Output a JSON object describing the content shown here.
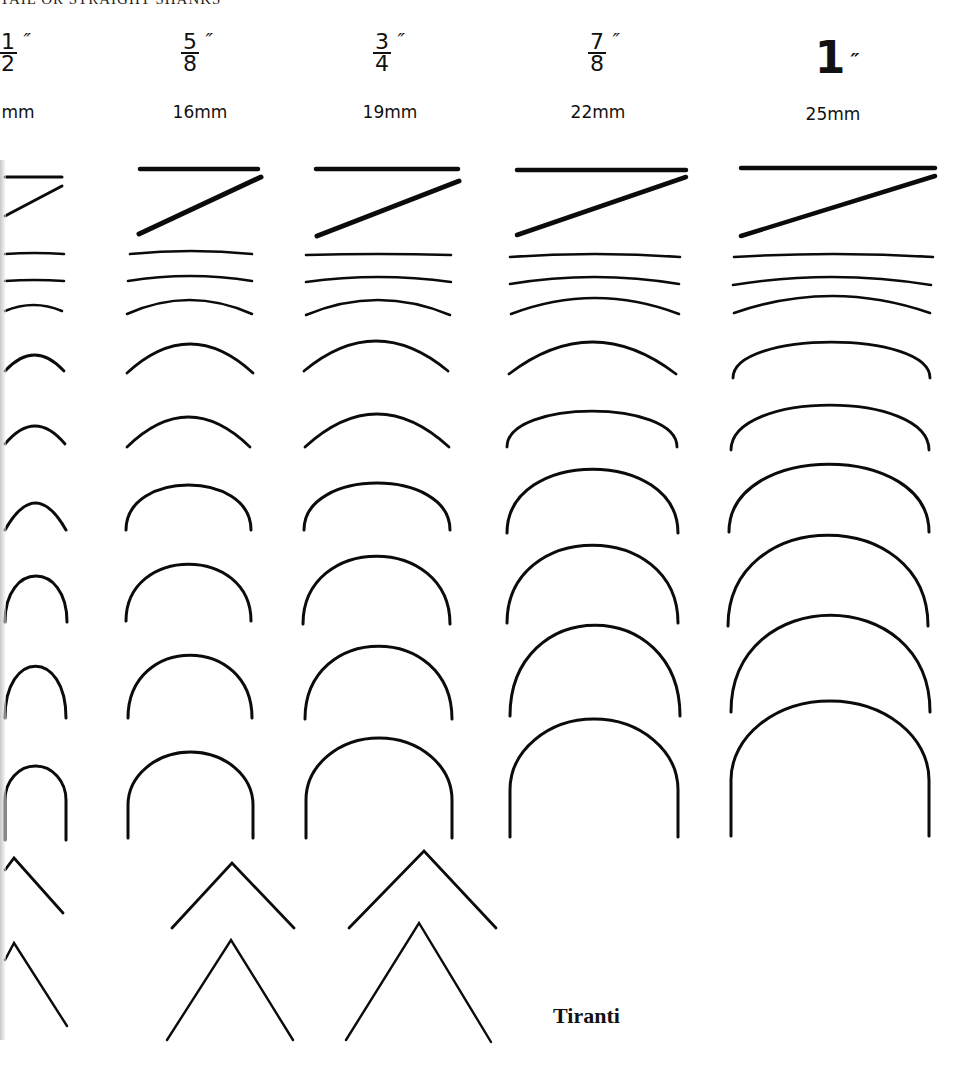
{
  "page": {
    "header_fragment": "TAIL OR STRAIGHT SHANKS",
    "caption": "Tiranti"
  },
  "columns": [
    {
      "id": "half",
      "numerator": "1",
      "denominator": "2",
      "inch_mark": "″",
      "mm": "13mm",
      "mm_visible": "mm",
      "left": -40,
      "center": 20
    },
    {
      "id": "5-8",
      "numerator": "5",
      "denominator": "8",
      "inch_mark": "″",
      "mm": "16mm",
      "mm_visible": "16mm",
      "left": 130,
      "center": 190
    },
    {
      "id": "3-4",
      "numerator": "3",
      "denominator": "4",
      "inch_mark": "″",
      "mm": "19mm",
      "mm_visible": "19mm",
      "left": 320,
      "center": 380
    },
    {
      "id": "7-8",
      "numerator": "7",
      "denominator": "8",
      "inch_mark": "″",
      "mm": "22mm",
      "mm_visible": "22mm",
      "left": 537,
      "center": 597
    },
    {
      "id": "1-inch",
      "whole": "1",
      "inch_mark": "″",
      "mm": "25mm",
      "mm_visible": "25mm",
      "left": 773,
      "center": 833
    }
  ],
  "chart_data": {
    "type": "table",
    "column_labels": [
      "1/2\" (13mm)",
      "5/8\" (16mm)",
      "3/4\" (19mm)",
      "7/8\" (22mm)",
      "1\" (25mm)"
    ],
    "row_labels": [
      "straight chisel",
      "skew chisel",
      "sweep 2",
      "sweep 3",
      "sweep 4",
      "sweep 5",
      "sweep 6",
      "sweep 7",
      "sweep 8",
      "sweep 9",
      "sweep 11 (U)",
      "V-tool wide",
      "V-tool narrow"
    ],
    "stroke_color": "#0b0b0b",
    "background": "#ffffff",
    "profiles": {
      "straight": [
        {
          "x1": 5,
          "x2": 62,
          "y": 177,
          "w": 3
        },
        {
          "x1": 140,
          "x2": 258,
          "y": 169,
          "w": 4.5
        },
        {
          "x1": 316,
          "x2": 458,
          "y": 169,
          "w": 4.5
        },
        {
          "x1": 517,
          "x2": 686,
          "y": 170,
          "w": 4.5
        },
        {
          "x1": 741,
          "x2": 935,
          "y": 168,
          "w": 4.5
        }
      ],
      "skew": [
        {
          "x1": 5,
          "y1": 216,
          "x2": 62,
          "y2": 186,
          "w": 3
        },
        {
          "x1": 139,
          "y1": 234,
          "x2": 261,
          "y2": 177,
          "w": 5
        },
        {
          "x1": 317,
          "y1": 236,
          "x2": 459,
          "y2": 181,
          "w": 5
        },
        {
          "x1": 517,
          "y1": 235,
          "x2": 686,
          "y2": 177,
          "w": 4.5
        },
        {
          "x1": 741,
          "y1": 236,
          "x2": 935,
          "y2": 176,
          "w": 4.5
        }
      ],
      "arcs": [
        {
          "row": 2,
          "items": [
            {
              "x1": 5,
              "x2": 64,
              "y": 254,
              "sag": 1,
              "w": 2.6
            },
            {
              "x1": 130,
              "x2": 252,
              "y": 254,
              "sag": 3,
              "w": 2.6
            },
            {
              "x1": 306,
              "x2": 451,
              "y": 255,
              "sag": 1,
              "w": 2.6
            },
            {
              "x1": 510,
              "x2": 680,
              "y": 257,
              "sag": 3,
              "w": 2.6
            },
            {
              "x1": 734,
              "x2": 933,
              "y": 257,
              "sag": 3,
              "w": 2.6
            }
          ]
        },
        {
          "row": 3,
          "items": [
            {
              "x1": 5,
              "x2": 64,
              "y": 281,
              "sag": 1,
              "w": 2.6
            },
            {
              "x1": 128,
              "x2": 252,
              "y": 281,
              "sag": 5,
              "w": 2.6
            },
            {
              "x1": 306,
              "x2": 451,
              "y": 282,
              "sag": 5,
              "w": 2.6
            },
            {
              "x1": 510,
              "x2": 679,
              "y": 284,
              "sag": 7,
              "w": 2.6
            },
            {
              "x1": 733,
              "x2": 931,
              "y": 285,
              "sag": 8,
              "w": 2.6
            }
          ]
        },
        {
          "row": 4,
          "items": [
            {
              "x1": 5,
              "x2": 62,
              "y": 311,
              "sag": 6,
              "w": 2.6
            },
            {
              "x1": 127,
              "x2": 252,
              "y": 314,
              "sag": 14,
              "w": 2.6
            },
            {
              "x1": 306,
              "x2": 450,
              "y": 315,
              "sag": 15,
              "w": 2.6
            },
            {
              "x1": 511,
              "x2": 679,
              "y": 314,
              "sag": 16,
              "w": 2.6
            },
            {
              "x1": 734,
              "x2": 930,
              "y": 313,
              "sag": 17,
              "w": 2.6
            }
          ]
        },
        {
          "row": 5,
          "items": [
            {
              "x1": 5,
              "x2": 64,
              "y": 371,
              "sag": 16,
              "w": 2.8
            },
            {
              "x1": 127,
              "x2": 253,
              "y": 373,
              "sag": 29,
              "w": 2.8
            },
            {
              "x1": 304,
              "x2": 448,
              "y": 371,
              "sag": 30,
              "w": 2.8
            },
            {
              "x1": 509,
              "x2": 676,
              "y": 374,
              "sag": 32,
              "w": 2.8
            },
            {
              "x1": 733,
              "x2": 930,
              "y": 378,
              "sag": 36,
              "w": 2.8
            }
          ]
        },
        {
          "row": 6,
          "items": [
            {
              "x1": 5,
              "x2": 65,
              "y": 444,
              "sag": 18,
              "w": 2.8
            },
            {
              "x1": 127,
              "x2": 250,
              "y": 447,
              "sag": 30,
              "w": 2.8
            },
            {
              "x1": 305,
              "x2": 449,
              "y": 447,
              "sag": 33,
              "w": 2.8
            },
            {
              "x1": 507,
              "x2": 677,
              "y": 447,
              "sag": 36,
              "w": 2.8
            },
            {
              "x1": 731,
              "x2": 929,
              "y": 450,
              "sag": 45,
              "w": 2.8
            }
          ]
        },
        {
          "row": 7,
          "items": [
            {
              "x1": 5,
              "x2": 66,
              "y": 530,
              "sag": 27,
              "w": 3
            },
            {
              "x1": 126,
              "x2": 251,
              "y": 530,
              "sag": 45,
              "w": 3
            },
            {
              "x1": 304,
              "x2": 450,
              "y": 530,
              "sag": 47,
              "w": 3
            },
            {
              "x1": 507,
              "x2": 678,
              "y": 533,
              "sag": 64,
              "w": 3
            },
            {
              "x1": 729,
              "x2": 929,
              "y": 532,
              "sag": 68,
              "w": 3
            }
          ]
        },
        {
          "row": 8,
          "items": [
            {
              "x1": 5,
              "x2": 67,
              "y": 622,
              "sag": 46,
              "w": 3
            },
            {
              "x1": 126,
              "x2": 251,
              "y": 621,
              "sag": 57,
              "w": 3
            },
            {
              "x1": 303,
              "x2": 450,
              "y": 624,
              "sag": 68,
              "w": 3
            },
            {
              "x1": 507,
              "x2": 678,
              "y": 623,
              "sag": 78,
              "w": 3
            },
            {
              "x1": 728,
              "x2": 928,
              "y": 626,
              "sag": 91,
              "w": 3
            }
          ]
        },
        {
          "row": 9,
          "items": [
            {
              "x1": 5,
              "x2": 66,
              "y": 718,
              "sag": 52,
              "w": 3
            },
            {
              "x1": 128,
              "x2": 252,
              "y": 718,
              "sag": 63,
              "w": 3
            },
            {
              "x1": 305,
              "x2": 452,
              "y": 719,
              "sag": 73,
              "w": 3
            },
            {
              "x1": 510,
              "x2": 680,
              "y": 716,
              "sag": 91,
              "w": 3
            },
            {
              "x1": 731,
              "x2": 930,
              "y": 712,
              "sag": 97,
              "w": 3
            }
          ]
        }
      ],
      "u_shapes": [
        {
          "x1": 5,
          "x2": 66,
          "top": 766,
          "straight_bottom": 840,
          "shoulder": 800,
          "w": 3
        },
        {
          "x1": 128,
          "x2": 253,
          "top": 752,
          "straight_bottom": 838,
          "shoulder": 805,
          "w": 3
        },
        {
          "x1": 306,
          "x2": 452,
          "top": 738,
          "straight_bottom": 838,
          "shoulder": 800,
          "w": 3
        },
        {
          "x1": 510,
          "x2": 678,
          "top": 719,
          "straight_bottom": 837,
          "shoulder": 790,
          "w": 3
        },
        {
          "x1": 731,
          "x2": 929,
          "top": 701,
          "straight_bottom": 836,
          "shoulder": 780,
          "w": 3
        }
      ],
      "v_tools": [
        {
          "row": "wide",
          "items": [
            {
              "xl": 5,
              "yl": 870,
              "apex_x": 14,
              "apex_y": 858,
              "xr": 63,
              "yr": 913,
              "w": 2.8
            },
            {
              "xl": 172,
              "yl": 928,
              "apex_x": 232,
              "apex_y": 863,
              "xr": 294,
              "yr": 928,
              "w": 2.8
            },
            {
              "xl": 349,
              "yl": 928,
              "apex_x": 424,
              "apex_y": 851,
              "xr": 496,
              "yr": 928,
              "w": 2.8
            }
          ]
        },
        {
          "row": "narrow",
          "items": [
            {
              "xl": 5,
              "yl": 960,
              "apex_x": 14,
              "apex_y": 943,
              "xr": 67,
              "yr": 1026,
              "w": 2.4
            },
            {
              "xl": 167,
              "yl": 1040,
              "apex_x": 231,
              "apex_y": 940,
              "xr": 293,
              "yr": 1040,
              "w": 2.4
            },
            {
              "xl": 346,
              "yl": 1040,
              "apex_x": 419,
              "apex_y": 923,
              "xr": 491,
              "yr": 1042,
              "w": 2.4
            }
          ]
        }
      ]
    }
  }
}
